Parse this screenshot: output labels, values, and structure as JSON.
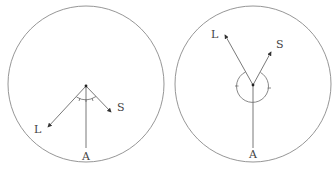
{
  "diagrams": [
    {
      "id": "left",
      "description": "Acute angle between L and S rays below vertex, A ray straight down",
      "labels": {
        "L": "L",
        "S": "S",
        "A": "A"
      }
    },
    {
      "id": "right",
      "description": "Reflex angle between L and S rays around bottom of vertex, A ray straight down",
      "labels": {
        "L": "L",
        "S": "S",
        "A": "A"
      }
    }
  ],
  "colors": {
    "stroke": "#6a6a6a",
    "circle": "#8a8a8a",
    "text": "#444444"
  }
}
